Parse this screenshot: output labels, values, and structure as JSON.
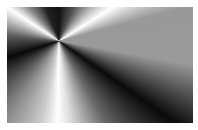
{
  "image": {
    "description": "Grayscale conic gradient with radial light beams converging at a center point",
    "center": {
      "x": 59,
      "y": 41
    },
    "colors": {
      "dark": "#111111",
      "light": "#ffffff",
      "mid": "#999999"
    }
  }
}
